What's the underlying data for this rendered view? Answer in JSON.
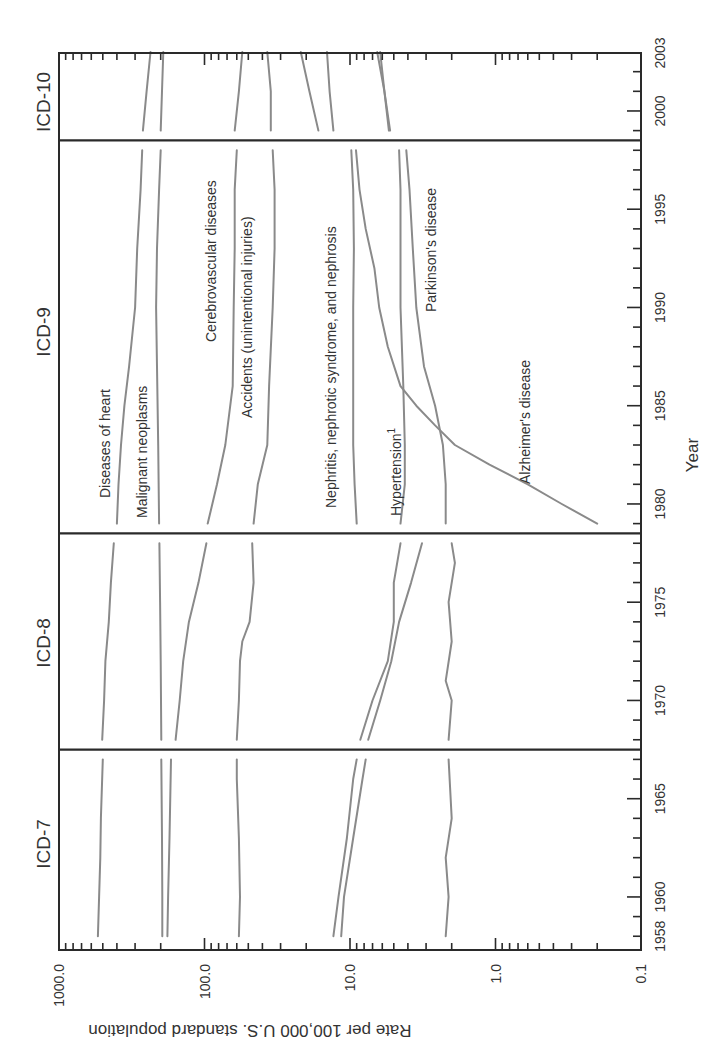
{
  "chart_data": {
    "type": "line",
    "orientation": "rotated-90-ccw",
    "title": "",
    "xlabel": "Year",
    "ylabel": "Rate per 100,000 U.S. standard population",
    "yscale": "log",
    "ylim": [
      0.1,
      1000.0
    ],
    "xlim": [
      1958,
      2003
    ],
    "y_ticks": [
      "1000.0",
      "100.0",
      "10.0",
      "1.0",
      "0.1"
    ],
    "x_ticks": [
      "1958",
      "1960",
      "1965",
      "1970",
      "1975",
      "1980",
      "1985",
      "1990",
      "1995",
      "2000",
      "2003"
    ],
    "grid": false,
    "legend": "inline-labels",
    "eras": [
      {
        "label": "ICD-7",
        "start": 1958,
        "end": 1967.5
      },
      {
        "label": "ICD-8",
        "start": 1967.5,
        "end": 1978.5
      },
      {
        "label": "ICD-9",
        "start": 1978.5,
        "end": 1998.5
      },
      {
        "label": "ICD-10",
        "start": 1998.5,
        "end": 2003
      }
    ],
    "era_dividers": [
      1967.5,
      1978.5,
      1998.5
    ],
    "series": [
      {
        "name": "Diseases of heart",
        "points": [
          [
            1958,
            540
          ],
          [
            1960,
            530
          ],
          [
            1962,
            520
          ],
          [
            1964,
            515
          ],
          [
            1967,
            500
          ],
          [
            1968,
            505
          ],
          [
            1970,
            490
          ],
          [
            1972,
            480
          ],
          [
            1974,
            455
          ],
          [
            1976,
            440
          ],
          [
            1978,
            420
          ],
          [
            1979,
            400
          ],
          [
            1981,
            390
          ],
          [
            1983,
            375
          ],
          [
            1985,
            355
          ],
          [
            1987,
            330
          ],
          [
            1990,
            300
          ],
          [
            1993,
            290
          ],
          [
            1996,
            275
          ],
          [
            1998,
            268
          ],
          [
            1999,
            265
          ],
          [
            2001,
            250
          ],
          [
            2003,
            235
          ]
        ]
      },
      {
        "name": "Malignant neoplasms",
        "points": [
          [
            1958,
            195
          ],
          [
            1960,
            195
          ],
          [
            1963,
            196
          ],
          [
            1967,
            198
          ],
          [
            1968,
            198
          ],
          [
            1972,
            200
          ],
          [
            1975,
            202
          ],
          [
            1978,
            204
          ],
          [
            1979,
            205
          ],
          [
            1983,
            208
          ],
          [
            1987,
            212
          ],
          [
            1990,
            215
          ],
          [
            1993,
            212
          ],
          [
            1996,
            205
          ],
          [
            1998,
            200
          ],
          [
            1999,
            200
          ],
          [
            2001,
            196
          ],
          [
            2003,
            192
          ]
        ]
      },
      {
        "name": "Cerebrovascular diseases",
        "points": [
          [
            1958,
            180
          ],
          [
            1960,
            178
          ],
          [
            1963,
            174
          ],
          [
            1967,
            170
          ],
          [
            1968,
            158
          ],
          [
            1970,
            148
          ],
          [
            1972,
            140
          ],
          [
            1974,
            128
          ],
          [
            1976,
            110
          ],
          [
            1978,
            97
          ],
          [
            1979,
            95
          ],
          [
            1981,
            82
          ],
          [
            1983,
            72
          ],
          [
            1986,
            64
          ],
          [
            1990,
            63
          ],
          [
            1993,
            62
          ],
          [
            1996,
            62
          ],
          [
            1998,
            60
          ],
          [
            1999,
            62
          ],
          [
            2001,
            58
          ],
          [
            2003,
            55
          ]
        ]
      },
      {
        "name": "Accidents (unintentional injuries)",
        "points": [
          [
            1958,
            58
          ],
          [
            1960,
            57
          ],
          [
            1963,
            58
          ],
          [
            1966,
            60
          ],
          [
            1967,
            60
          ],
          [
            1968,
            60
          ],
          [
            1970,
            58
          ],
          [
            1972,
            57
          ],
          [
            1973,
            55
          ],
          [
            1974,
            49
          ],
          [
            1976,
            46
          ],
          [
            1978,
            47
          ],
          [
            1979,
            46
          ],
          [
            1981,
            43
          ],
          [
            1983,
            37
          ],
          [
            1986,
            36
          ],
          [
            1990,
            34
          ],
          [
            1993,
            33
          ],
          [
            1996,
            33
          ],
          [
            1998,
            34
          ],
          [
            1999,
            35
          ],
          [
            2001,
            35
          ],
          [
            2003,
            37
          ]
        ]
      },
      {
        "name": "Nephritis, nephrotic syndrome, and nephrosis",
        "points": [
          [
            1958,
            13
          ],
          [
            1960,
            12
          ],
          [
            1963,
            10.5
          ],
          [
            1966,
            9.5
          ],
          [
            1967,
            9
          ],
          [
            1968,
            8.5
          ],
          [
            1970,
            7
          ],
          [
            1972,
            5.5
          ],
          [
            1974,
            5
          ],
          [
            1976,
            5
          ],
          [
            1978,
            4.5
          ],
          [
            1979,
            9
          ],
          [
            1981,
            9.3
          ],
          [
            1983,
            9.5
          ],
          [
            1986,
            9.5
          ],
          [
            1990,
            9.5
          ],
          [
            1993,
            9.4
          ],
          [
            1996,
            9.5
          ],
          [
            1998,
            9.8
          ],
          [
            1999,
            13.0
          ],
          [
            2001,
            13.8
          ],
          [
            2003,
            14.4
          ]
        ]
      },
      {
        "name": "Hypertension 1",
        "points": [
          [
            1958,
            11.5
          ],
          [
            1960,
            11
          ],
          [
            1963,
            9.5
          ],
          [
            1966,
            8.2
          ],
          [
            1967,
            7.8
          ],
          [
            1968,
            7.5
          ],
          [
            1970,
            6.2
          ],
          [
            1972,
            5.2
          ],
          [
            1974,
            4.6
          ],
          [
            1976,
            3.8
          ],
          [
            1978,
            3.2
          ],
          [
            1979,
            4.5
          ],
          [
            1981,
            4.2
          ],
          [
            1983,
            4.2
          ],
          [
            1986,
            4.3
          ],
          [
            1990,
            4.5
          ],
          [
            1993,
            4.5
          ],
          [
            1996,
            4.5
          ],
          [
            1998,
            4.6
          ],
          [
            1999,
            5.3
          ],
          [
            2001,
            5.8
          ],
          [
            2003,
            6.2
          ]
        ]
      },
      {
        "name": "Parkinson's disease",
        "points": [
          [
            1958,
            2.2
          ],
          [
            1960,
            2.1
          ],
          [
            1962,
            2.2
          ],
          [
            1964,
            2.0
          ],
          [
            1967,
            2.1
          ],
          [
            1968,
            2.1
          ],
          [
            1970,
            2.0
          ],
          [
            1971,
            2.2
          ],
          [
            1973,
            2.0
          ],
          [
            1975,
            2.1
          ],
          [
            1977,
            1.9
          ],
          [
            1978,
            2.0
          ],
          [
            1979,
            2.2
          ],
          [
            1981,
            2.2
          ],
          [
            1983,
            2.3
          ],
          [
            1985,
            2.6
          ],
          [
            1987,
            3.1
          ],
          [
            1990,
            3.5
          ],
          [
            1993,
            3.7
          ],
          [
            1996,
            3.9
          ],
          [
            1998,
            4.1
          ],
          [
            1999,
            5.4
          ],
          [
            2001,
            5.8
          ],
          [
            2003,
            6.5
          ]
        ]
      },
      {
        "name": "Alzheimer's disease",
        "points": [
          [
            1979,
            0.2
          ],
          [
            1980,
            0.35
          ],
          [
            1981,
            0.6
          ],
          [
            1982,
            1.1
          ],
          [
            1983,
            1.9
          ],
          [
            1984,
            2.6
          ],
          [
            1985,
            3.5
          ],
          [
            1986,
            4.5
          ],
          [
            1988,
            5.5
          ],
          [
            1990,
            6.3
          ],
          [
            1992,
            6.8
          ],
          [
            1994,
            7.8
          ],
          [
            1996,
            8.6
          ],
          [
            1998,
            9.1
          ],
          [
            1999,
            16.5
          ],
          [
            2001,
            19.0
          ],
          [
            2003,
            21.8
          ]
        ]
      }
    ],
    "annotations": [
      "Diseases of heart",
      "Malignant neoplasms",
      "Cerebrovascular diseases",
      "Accidents (unintentional injuries)",
      "Nephritis, nephrotic syndrome, and nephrosis",
      "Hypertension",
      "Parkinson's disease",
      "Alzheimer's disease"
    ]
  },
  "labels": {
    "ylabel": "Rate per 100,000 U.S. standard population",
    "xlabel": "Year",
    "eras": [
      "ICD-7",
      "ICD-8",
      "ICD-9",
      "ICD-10"
    ],
    "series_labels": {
      "heart": "Diseases of heart",
      "malignant": "Malignant neoplasms",
      "cerebro": "Cerebrovascular diseases",
      "accidents": "Accidents (unintentional injuries)",
      "nephritis": "Nephritis, nephrotic syndrome, and nephrosis",
      "hypertension": "Hypertension",
      "hypertension_sup": "1",
      "parkinson": "Parkinson's disease",
      "alzheimer": "Alzheimer's disease"
    }
  },
  "colors": {
    "series_line": "#8a8a8a",
    "axis": "#2a2a2a",
    "text": "#333333",
    "background": "#ffffff"
  }
}
